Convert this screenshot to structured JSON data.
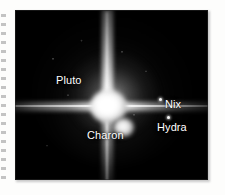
{
  "figure": {
    "kind": "astronomical-photograph",
    "background_color": "#000000",
    "label_color": "#ffffff",
    "page_color": "#fdfdfc",
    "objects": [
      {
        "id": "pluto",
        "label": "Pluto",
        "marker": "bright-blob",
        "description": "central saturated object with four-point diffraction spikes"
      },
      {
        "id": "charon",
        "label": "Charon",
        "marker": "bright-blob",
        "description": "smaller blob below and right of Pluto"
      },
      {
        "id": "nix",
        "label": "Nix",
        "marker": "point-dot",
        "description": "faint point to the right of Pluto"
      },
      {
        "id": "hydra",
        "label": "Hydra",
        "marker": "point-dot",
        "description": "faint point lower right of Pluto"
      }
    ],
    "features": {
      "vertical_spike": "diffraction spike spanning full frame height",
      "horizontal_spike": "diffraction spike spanning full frame width",
      "halo": "diffuse nebulous glow around Pluto"
    }
  },
  "decoration": {
    "perforation": "dotted binding marks along left page edge"
  }
}
